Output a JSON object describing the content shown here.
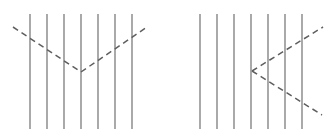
{
  "figure": {
    "background_color": "#ffffff",
    "width": 331,
    "height": 137,
    "grating_color": "#6b6b6b",
    "chevron_color": "#5e5e5e",
    "chevron_dash_pattern": "6 4.2",
    "grating_stroke_width": 1.15,
    "chevron_stroke_width": 1.5
  },
  "panels": [
    {
      "id": "left-panel",
      "name": "Left panel: downward V chevron over vertical grating",
      "grating": {
        "count": 7,
        "y_top": 14,
        "y_bottom": 129,
        "x_positions": [
          30,
          47,
          64,
          81,
          98,
          115,
          132
        ]
      },
      "chevron": {
        "shape": "V",
        "orientation": "vertex-down",
        "vertex": {
          "x": 81,
          "y": 72
        },
        "arms": [
          {
            "name": "left-arm",
            "x1": 13,
            "y1": 27,
            "x2": 81,
            "y2": 72
          },
          {
            "name": "right-arm",
            "x1": 81,
            "y1": 72,
            "x2": 147,
            "y2": 27
          }
        ]
      }
    },
    {
      "id": "right-panel",
      "name": "Right panel: leftward < chevron over vertical grating",
      "grating": {
        "count": 7,
        "y_top": 14,
        "y_bottom": 129,
        "x_positions": [
          200,
          217,
          234,
          251,
          268,
          285,
          302
        ]
      },
      "chevron": {
        "shape": "<",
        "orientation": "vertex-left",
        "vertex": {
          "x": 252,
          "y": 71
        },
        "arms": [
          {
            "name": "upper-arm",
            "x1": 252,
            "y1": 71,
            "x2": 323,
            "y2": 27
          },
          {
            "name": "lower-arm",
            "x1": 252,
            "y1": 71,
            "x2": 322,
            "y2": 115
          }
        ]
      }
    }
  ]
}
